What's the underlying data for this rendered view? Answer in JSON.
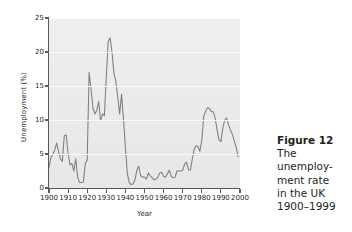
{
  "figure": {
    "caption_title": "Figure 12",
    "caption_lines": [
      "The",
      "unemploy-",
      "ment rate",
      "in the UK",
      "1900–1999"
    ]
  },
  "chart_data": {
    "type": "line",
    "title": "",
    "xlabel": "Year",
    "ylabel": "Unemployment (%)",
    "xlim": [
      1900,
      2000
    ],
    "ylim": [
      0,
      25
    ],
    "xticks": [
      1900,
      1910,
      1920,
      1930,
      1940,
      1950,
      1960,
      1970,
      1980,
      1990,
      2000
    ],
    "yticks": [
      0,
      5,
      10,
      15,
      20,
      25
    ],
    "grid": "horizontal-white",
    "legend": "none",
    "line_color": "#7d7d7d",
    "plot_background": "#ebebeb",
    "series": [
      {
        "name": "UK unemployment rate",
        "x": [
          1900,
          1901,
          1902,
          1903,
          1904,
          1905,
          1906,
          1907,
          1908,
          1909,
          1910,
          1911,
          1912,
          1913,
          1914,
          1915,
          1916,
          1917,
          1918,
          1919,
          1920,
          1921,
          1922,
          1923,
          1924,
          1925,
          1926,
          1927,
          1928,
          1929,
          1930,
          1931,
          1932,
          1933,
          1934,
          1935,
          1936,
          1937,
          1938,
          1939,
          1940,
          1941,
          1942,
          1943,
          1944,
          1945,
          1946,
          1947,
          1948,
          1949,
          1950,
          1951,
          1952,
          1953,
          1954,
          1955,
          1956,
          1957,
          1958,
          1959,
          1960,
          1961,
          1962,
          1963,
          1964,
          1965,
          1966,
          1967,
          1968,
          1969,
          1970,
          1971,
          1972,
          1973,
          1974,
          1975,
          1976,
          1977,
          1978,
          1979,
          1980,
          1981,
          1982,
          1983,
          1984,
          1985,
          1986,
          1987,
          1988,
          1989,
          1990,
          1991,
          1992,
          1993,
          1994,
          1995,
          1996,
          1997,
          1998,
          1999
        ],
        "values": [
          3.0,
          4.5,
          4.9,
          5.6,
          6.6,
          5.4,
          4.3,
          3.9,
          7.7,
          7.8,
          5.0,
          3.4,
          3.6,
          2.5,
          4.3,
          1.6,
          0.8,
          0.8,
          0.9,
          3.6,
          4.1,
          17.0,
          14.6,
          11.8,
          10.9,
          11.4,
          12.7,
          9.9,
          10.9,
          10.6,
          16.4,
          21.5,
          22.1,
          19.9,
          16.9,
          15.7,
          13.3,
          10.9,
          13.8,
          10.1,
          6.0,
          2.2,
          0.8,
          0.5,
          0.6,
          1.2,
          2.6,
          3.2,
          1.8,
          1.6,
          1.6,
          1.3,
          2.2,
          1.8,
          1.5,
          1.2,
          1.3,
          1.6,
          2.2,
          2.3,
          1.7,
          1.6,
          2.1,
          2.6,
          1.7,
          1.5,
          1.6,
          2.5,
          2.5,
          2.5,
          2.6,
          3.5,
          3.8,
          2.7,
          2.6,
          4.2,
          5.7,
          6.2,
          6.1,
          5.4,
          7.0,
          10.5,
          11.3,
          11.8,
          11.7,
          11.2,
          11.2,
          10.3,
          8.5,
          7.1,
          6.8,
          8.8,
          10.0,
          10.3,
          9.3,
          8.5,
          7.9,
          6.9,
          6.0,
          4.6
        ]
      }
    ]
  }
}
